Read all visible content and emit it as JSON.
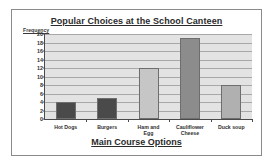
{
  "figure": {
    "frame_border_color": "#8a8a8a",
    "background_color": "#ffffff"
  },
  "chart_data": {
    "type": "bar",
    "title": "Popular Choices at the School Canteen",
    "xlabel": "Main Course Options",
    "ylabel": "Frequency",
    "categories": [
      "Hot Dogs",
      "Burgers",
      "Ham and Egg",
      "Cauliflower Cheese",
      "Duck soup"
    ],
    "category_lines": [
      [
        "Hot Dogs"
      ],
      [
        "Burgers"
      ],
      [
        "Ham and",
        "Egg"
      ],
      [
        "Cauliflower",
        "Cheese"
      ],
      [
        "Duck soup"
      ]
    ],
    "values": [
      4,
      5,
      12,
      19,
      8
    ],
    "bar_colors": [
      "#4a4a4a",
      "#4a4a4a",
      "#c6c6c6",
      "#8c8c8c",
      "#b0b0b0"
    ],
    "ylim": [
      0,
      20
    ],
    "ytick_step": 2,
    "yticks": [
      0,
      2,
      4,
      6,
      8,
      10,
      12,
      14,
      16,
      18,
      20
    ],
    "ytick_labels": [
      "0",
      "2",
      "4",
      "6",
      "8",
      "10",
      "12",
      "14",
      "16",
      "18",
      "20"
    ],
    "grid": true,
    "grid_axis": "y",
    "grid_color": "#a8a8a8",
    "plot_background": "#e3e3e3",
    "axis_color": "#4a4a4a",
    "legend": false
  }
}
